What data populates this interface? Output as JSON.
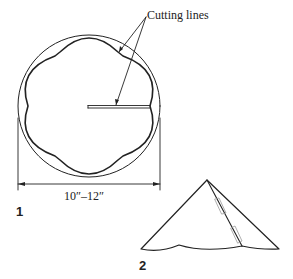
{
  "diagram": {
    "callout_label": "Cutting lines",
    "dimension_label": "10″–12″",
    "figures": [
      {
        "number": "1",
        "description": "circle with six-lobed scalloped cut and radial slit"
      },
      {
        "number": "2",
        "description": "folded cone with scalloped bottom edge and tabs along seam"
      }
    ]
  }
}
